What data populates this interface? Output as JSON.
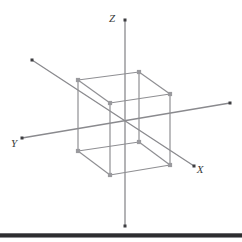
{
  "figure": {
    "background_color": "#ffffff",
    "width": 242,
    "height": 242
  },
  "style": {
    "axis_color": "#8a8a8e",
    "axis_width": 1.3,
    "cube_edge_color": "#8f8f93",
    "cube_edge_width": 1.2,
    "vertex_marker_color": "#9a9a9e",
    "vertex_marker_size": 4.2,
    "endpoint_marker_color": "#3d3d40",
    "endpoint_marker_size": 3,
    "label_color": "#3a3a3a",
    "rule_color": "#2e2e30"
  },
  "axes": [
    {
      "name": "z-axis",
      "label": "Z",
      "label_x": 112,
      "label_y": 22,
      "start_x": 125,
      "start_y": 20,
      "end_x": 125,
      "end_y": 226,
      "start_marker": true,
      "end_marker": true
    },
    {
      "name": "y-axis",
      "label": "Y",
      "label_x": 14,
      "label_y": 147,
      "start_x": 230,
      "start_y": 103,
      "end_x": 22,
      "end_y": 138,
      "start_marker": true,
      "end_marker": true
    },
    {
      "name": "x-axis",
      "label": "X",
      "label_x": 200,
      "label_y": 173,
      "start_x": 32,
      "start_y": 60,
      "end_x": 194,
      "end_y": 166,
      "start_marker": true,
      "end_marker": true
    }
  ],
  "cube": {
    "name": "wireframe-cube",
    "vertices": [
      {
        "id": "back-top-left",
        "x": 78,
        "y": 80
      },
      {
        "id": "back-top-right",
        "x": 139,
        "y": 72
      },
      {
        "id": "front-top-left",
        "x": 110,
        "y": 103
      },
      {
        "id": "front-top-right",
        "x": 170,
        "y": 94
      },
      {
        "id": "back-bottom-left",
        "x": 78,
        "y": 151
      },
      {
        "id": "back-bottom-right",
        "x": 139,
        "y": 142
      },
      {
        "id": "front-bottom-left",
        "x": 110,
        "y": 175
      },
      {
        "id": "front-bottom-right",
        "x": 170,
        "y": 165
      }
    ],
    "edges": [
      [
        "back-top-left",
        "back-top-right"
      ],
      [
        "back-top-right",
        "front-top-right"
      ],
      [
        "front-top-right",
        "front-top-left"
      ],
      [
        "front-top-left",
        "back-top-left"
      ],
      [
        "back-bottom-left",
        "back-bottom-right"
      ],
      [
        "back-bottom-right",
        "front-bottom-right"
      ],
      [
        "front-bottom-right",
        "front-bottom-left"
      ],
      [
        "front-bottom-left",
        "back-bottom-left"
      ],
      [
        "back-top-left",
        "back-bottom-left"
      ],
      [
        "back-top-right",
        "back-bottom-right"
      ],
      [
        "front-top-left",
        "front-bottom-left"
      ],
      [
        "front-top-right",
        "front-bottom-right"
      ]
    ]
  },
  "bottom_rule": {
    "name": "bottom-divider",
    "y": 233,
    "height": 3
  }
}
